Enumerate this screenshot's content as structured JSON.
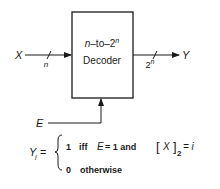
{
  "diagram": {
    "type": "block-diagram",
    "block": {
      "line1_prefix": "n",
      "line1_mid": "–to–2",
      "line1_sup": "n",
      "line2": "Decoder"
    },
    "input": {
      "label": "X",
      "bus_width": "n"
    },
    "output": {
      "label": "Y",
      "bus_width_base": "2",
      "bus_width_sup": "n"
    },
    "enable": {
      "label": "E"
    },
    "equation": {
      "lhs_var": "Y",
      "lhs_sub": "i",
      "equals": "=",
      "case1": {
        "value": "1",
        "iff": "iff",
        "cond_var": "E",
        "cond_eq": "= 1 and",
        "bracket_open": "[",
        "bracket_var": "X",
        "bracket_close": "]",
        "bracket_sub": "2",
        "rhs": "= i"
      },
      "case2": {
        "value": "0",
        "text": "otherwise"
      }
    }
  },
  "colors": {
    "ink": "#1a1a1a",
    "background": "#ffffff"
  }
}
